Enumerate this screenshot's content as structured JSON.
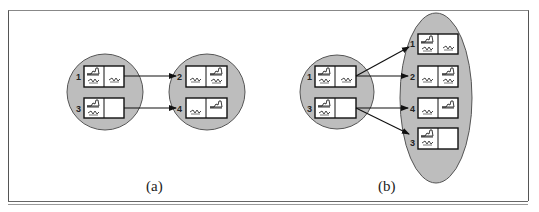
{
  "figure": {
    "panels": [
      {
        "id": "a",
        "caption": "(a)",
        "left_group": {
          "shape": "circle",
          "items": [
            {
              "label": "1",
              "left_cell": [
                "foot",
                "squiggle"
              ],
              "right_cell": [
                "squiggle"
              ]
            },
            {
              "label": "3",
              "left_cell": [
                "foot",
                "squiggle"
              ],
              "right_cell": []
            }
          ]
        },
        "right_group": {
          "shape": "circle",
          "items": [
            {
              "label": "2",
              "left_cell": [
                "squiggle"
              ],
              "right_cell": [
                "foot",
                "squiggle"
              ]
            },
            {
              "label": "4",
              "left_cell": [
                "squiggle"
              ],
              "right_cell": [
                "foot"
              ]
            }
          ]
        },
        "edges": [
          [
            "1",
            "2"
          ],
          [
            "3",
            "4"
          ]
        ]
      },
      {
        "id": "b",
        "caption": "(b)",
        "left_group": {
          "shape": "circle",
          "items": [
            {
              "label": "1",
              "left_cell": [
                "foot",
                "squiggle"
              ],
              "right_cell": [
                "squiggle"
              ]
            },
            {
              "label": "3",
              "left_cell": [
                "foot",
                "squiggle"
              ],
              "right_cell": []
            }
          ]
        },
        "right_group": {
          "shape": "ellipse",
          "items": [
            {
              "label": "1",
              "left_cell": [
                "foot",
                "squiggle"
              ],
              "right_cell": [
                "squiggle"
              ]
            },
            {
              "label": "2",
              "left_cell": [
                "squiggle"
              ],
              "right_cell": [
                "foot",
                "squiggle"
              ]
            },
            {
              "label": "4",
              "left_cell": [
                "squiggle"
              ],
              "right_cell": [
                "foot"
              ]
            },
            {
              "label": "3",
              "left_cell": [
                "foot",
                "squiggle"
              ],
              "right_cell": []
            }
          ]
        },
        "edges": [
          [
            "1",
            "1"
          ],
          [
            "1",
            "2"
          ],
          [
            "3",
            "4"
          ],
          [
            "3",
            "3"
          ]
        ]
      }
    ],
    "colors": {
      "group_fill": "#bdbdbd",
      "group_stroke": "#555555",
      "box_stroke": "#111111",
      "box_fill": "#ffffff"
    }
  },
  "labels": {
    "a_caption": "(a)",
    "b_caption": "(b)",
    "a_l1": "1",
    "a_l3": "3",
    "a_r2": "2",
    "a_r4": "4",
    "b_l1": "1",
    "b_l3": "3",
    "b_r1": "1",
    "b_r2": "2",
    "b_r4": "4",
    "b_r3": "3"
  }
}
